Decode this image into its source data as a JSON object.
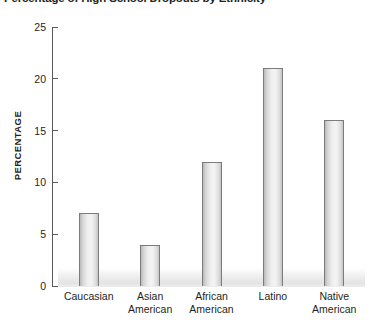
{
  "chart_data": {
    "type": "bar",
    "title": "Percentage of High School Dropouts by Ethnicity",
    "xlabel": "",
    "ylabel": "PERCENTAGE",
    "categories": [
      "Caucasian",
      "Asian American",
      "African American",
      "Latino",
      "Native American"
    ],
    "category_lines": [
      [
        "Caucasian"
      ],
      [
        "Asian",
        "American"
      ],
      [
        "African",
        "American"
      ],
      [
        "Latino"
      ],
      [
        "Native",
        "American"
      ]
    ],
    "values": [
      7,
      4,
      12,
      21,
      16
    ],
    "ylim": [
      0,
      25
    ],
    "ytick_labels": [
      "0",
      "5",
      "10",
      "15",
      "20",
      "25"
    ],
    "ytick_values": [
      0,
      5,
      10,
      15,
      20,
      25
    ],
    "grid": false,
    "legend": false,
    "colors": {
      "bar_fill_light": "#f4f4f4",
      "bar_fill_dark": "#b9b9b9",
      "bar_border": "#7b7b7b",
      "axis": "#58595b",
      "text": "#231f20",
      "floor": "#e4e4e4"
    }
  }
}
